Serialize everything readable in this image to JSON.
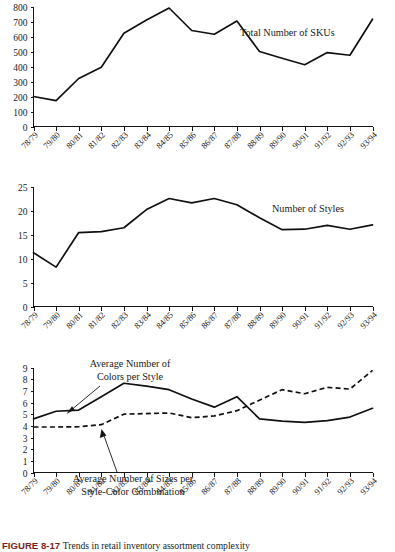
{
  "figure": {
    "caption_number": "FIGURE 8-17",
    "caption_text": "Trends in retail inventory assortment complexity",
    "x_categories": [
      "78/79",
      "79/80",
      "80/81",
      "81/82",
      "82/83",
      "83/84",
      "84/85",
      "85/86",
      "86/87",
      "87/88",
      "88/89",
      "89/90",
      "90/91",
      "91/92",
      "92/93",
      "93/94"
    ]
  },
  "chart_data": [
    {
      "type": "line",
      "title": "Total Number of SKUs",
      "annotation": "Total Number of SKUs",
      "xlabel": "",
      "ylabel": "",
      "grid": false,
      "legend": "inline-annotation",
      "ylim": [
        0,
        800
      ],
      "yticks": [
        0,
        100,
        200,
        300,
        400,
        500,
        600,
        700,
        800
      ],
      "categories": [
        "78/79",
        "79/80",
        "80/81",
        "81/82",
        "82/83",
        "83/84",
        "84/85",
        "85/86",
        "86/87",
        "87/88",
        "88/89",
        "89/90",
        "90/91",
        "91/92",
        "92/93",
        "93/94"
      ],
      "series": [
        {
          "name": "Total Number of SKUs",
          "style": "solid",
          "values": [
            200,
            172,
            320,
            395,
            622,
            710,
            790,
            640,
            615,
            703,
            500,
            455,
            412,
            493,
            475,
            715
          ]
        }
      ]
    },
    {
      "type": "line",
      "title": "Number of Styles",
      "annotation": "Number of Styles",
      "xlabel": "",
      "ylabel": "",
      "grid": false,
      "legend": "inline-annotation",
      "ylim": [
        0,
        25
      ],
      "yticks": [
        0,
        5,
        10,
        15,
        20,
        25
      ],
      "categories": [
        "78/79",
        "79/80",
        "80/81",
        "81/82",
        "82/83",
        "83/84",
        "84/85",
        "85/86",
        "86/87",
        "87/88",
        "88/89",
        "89/90",
        "90/91",
        "91/92",
        "92/93",
        "93/94"
      ],
      "series": [
        {
          "name": "Number of Styles",
          "style": "solid",
          "values": [
            11.2,
            8.2,
            15.4,
            15.6,
            16.4,
            20.2,
            22.5,
            21.6,
            22.5,
            21.2,
            18.5,
            16.0,
            16.1,
            16.9,
            16.1,
            17.0
          ]
        }
      ]
    },
    {
      "type": "line",
      "title": "Average Number of Colors per Style and Average Number of Sizes per Style-Color Combination",
      "annotation_colors": "Average Number of\nColors per Style",
      "annotation_colors_line1": "Average Number of",
      "annotation_colors_line2": "Colors per Style",
      "annotation_sizes_line1": "Average Number of Sizes per",
      "annotation_sizes_line2": "Style-Color Combination",
      "xlabel": "",
      "ylabel": "",
      "grid": false,
      "legend": "inline-annotation",
      "ylim": [
        0,
        9
      ],
      "yticks": [
        0,
        1,
        2,
        3,
        4,
        5,
        6,
        7,
        8,
        9
      ],
      "categories": [
        "78/79",
        "79/80",
        "80/81",
        "81/82",
        "82/83",
        "83/84",
        "84/85",
        "85/86",
        "86/87",
        "87/88",
        "88/89",
        "89/90",
        "90/91",
        "91/92",
        "92/93",
        "93/94"
      ],
      "series": [
        {
          "name": "Average Number of Colors per Style",
          "style": "solid",
          "values": [
            4.6,
            5.25,
            5.35,
            6.5,
            7.65,
            7.4,
            7.1,
            6.3,
            5.6,
            6.5,
            4.6,
            4.4,
            4.3,
            4.45,
            4.75,
            5.5
          ]
        },
        {
          "name": "Average Number of Sizes per Style-Color Combination",
          "style": "dashed",
          "values": [
            3.9,
            3.9,
            3.92,
            4.1,
            5.0,
            5.05,
            5.1,
            4.7,
            4.85,
            5.3,
            6.2,
            7.1,
            6.75,
            7.3,
            7.15,
            8.75
          ]
        }
      ]
    }
  ]
}
